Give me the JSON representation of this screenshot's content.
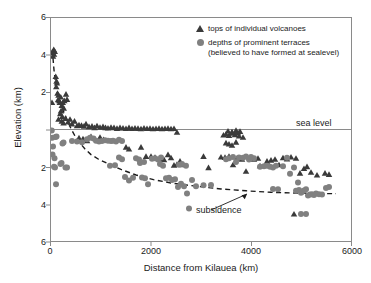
{
  "chart_data": {
    "type": "scatter",
    "title": "",
    "xlabel": "Distance from Kilauea (km)",
    "ylabel": "Elevation (km)",
    "xlim": [
      0,
      6000
    ],
    "ylim": [
      -6,
      6
    ],
    "xticks": [
      0,
      2000,
      4000,
      6000
    ],
    "xticklabels": [
      "0",
      "2000",
      "4000",
      "6000"
    ],
    "yticks": [
      6,
      4,
      2,
      0,
      -2,
      -4,
      -6
    ],
    "yticklabels": [
      "6",
      "4",
      "2",
      "",
      "2",
      "4",
      "6"
    ],
    "grid": false,
    "legend_position": "top-right",
    "annotations": [
      {
        "name": "sea-level-line",
        "text": "sea level",
        "y": 0,
        "type": "hline"
      },
      {
        "name": "subsidence-curve",
        "text": "subsidence",
        "type": "arrow-label",
        "points_to": [
          4450,
          -3.25
        ]
      }
    ],
    "series": [
      {
        "name": "tops of individual volcanoes",
        "marker": "triangle",
        "color": "#3a3a3a",
        "points": [
          [
            30,
            4.15
          ],
          [
            55,
            4.3
          ],
          [
            75,
            4.2
          ],
          [
            60,
            4.05
          ],
          [
            40,
            3.95
          ],
          [
            20,
            1.45
          ],
          [
            95,
            2.85
          ],
          [
            110,
            2.6
          ],
          [
            120,
            2.5
          ],
          [
            105,
            2.3
          ],
          [
            130,
            1.95
          ],
          [
            150,
            1.85
          ],
          [
            140,
            1.6
          ],
          [
            165,
            1.55
          ],
          [
            175,
            1.45
          ],
          [
            195,
            1.75
          ],
          [
            215,
            1.3
          ],
          [
            235,
            1.45
          ],
          [
            255,
            1.15
          ],
          [
            200,
            1.0
          ],
          [
            185,
            0.85
          ],
          [
            225,
            0.7
          ],
          [
            265,
            1.55
          ],
          [
            300,
            1.9
          ],
          [
            320,
            1.62
          ],
          [
            150,
            0.55
          ],
          [
            215,
            0.45
          ],
          [
            250,
            0.35
          ],
          [
            290,
            0.6
          ],
          [
            340,
            0.4
          ],
          [
            380,
            0.55
          ],
          [
            420,
            0.3
          ],
          [
            470,
            0.45
          ],
          [
            520,
            0.2
          ],
          [
            560,
            0.25
          ],
          [
            610,
            0.22
          ],
          [
            660,
            0.18
          ],
          [
            700,
            0.3
          ],
          [
            760,
            0.15
          ],
          [
            820,
            0.18
          ],
          [
            870,
            0.1
          ],
          [
            920,
            0.2
          ],
          [
            980,
            0.12
          ],
          [
            1040,
            0.15
          ],
          [
            1090,
            0.1
          ],
          [
            1140,
            0.08
          ],
          [
            1200,
            0.12
          ],
          [
            1260,
            0.1
          ],
          [
            1320,
            0.06
          ],
          [
            1380,
            0.1
          ],
          [
            1440,
            0.08
          ],
          [
            1500,
            0.05
          ],
          [
            1560,
            0.1
          ],
          [
            1620,
            0.05
          ],
          [
            1680,
            0.08
          ],
          [
            1740,
            0.06
          ],
          [
            1800,
            0.04
          ],
          [
            1860,
            0.08
          ],
          [
            1920,
            0.05
          ],
          [
            1980,
            0.06
          ],
          [
            2040,
            0.04
          ],
          [
            2100,
            0.05
          ],
          [
            2160,
            0.06
          ],
          [
            2220,
            0.04
          ],
          [
            2280,
            0.05
          ],
          [
            2340,
            0.06
          ],
          [
            2400,
            0.04
          ],
          [
            2460,
            0.05
          ],
          [
            2520,
            -0.15
          ],
          [
            560,
            -0.45
          ],
          [
            640,
            -0.5
          ],
          [
            720,
            -0.6
          ],
          [
            800,
            -0.38
          ],
          [
            980,
            -0.42
          ],
          [
            1050,
            -0.55
          ],
          [
            1500,
            -0.95
          ],
          [
            1560,
            -1.05
          ],
          [
            1800,
            -0.95
          ],
          [
            1900,
            -1.45
          ],
          [
            2000,
            -1.45
          ],
          [
            2080,
            -1.5
          ],
          [
            2200,
            -1.6
          ],
          [
            2260,
            -1.62
          ],
          [
            2340,
            -1.35
          ],
          [
            2400,
            -1.52
          ],
          [
            2460,
            -1.92
          ],
          [
            2520,
            -1.88
          ],
          [
            2580,
            -1.7
          ],
          [
            2640,
            -1.9
          ],
          [
            3050,
            -1.45
          ],
          [
            3150,
            -2.05
          ],
          [
            3450,
            -0.3
          ],
          [
            3500,
            -0.25
          ],
          [
            3560,
            -0.32
          ],
          [
            3620,
            -0.2
          ],
          [
            3680,
            -0.28
          ],
          [
            3740,
            -0.18
          ],
          [
            3500,
            -0.72
          ],
          [
            3560,
            -0.78
          ],
          [
            3620,
            -0.85
          ],
          [
            3700,
            -0.68
          ],
          [
            3400,
            -1.48
          ],
          [
            3480,
            -1.5
          ],
          [
            3560,
            -1.45
          ],
          [
            3640,
            -1.9
          ],
          [
            3720,
            -1.55
          ],
          [
            3820,
            -1.6
          ],
          [
            3900,
            -2.25
          ],
          [
            4180,
            -1.95
          ],
          [
            4320,
            -1.7
          ],
          [
            4400,
            -1.65
          ],
          [
            4480,
            -1.6
          ],
          [
            4560,
            -1.9
          ],
          [
            4640,
            -1.52
          ],
          [
            4720,
            -1.58
          ],
          [
            4800,
            -1.48
          ],
          [
            4900,
            -1.55
          ],
          [
            4980,
            -2.35
          ],
          [
            5060,
            -2.1
          ],
          [
            5120,
            -2.0
          ],
          [
            5200,
            -2.3
          ],
          [
            5320,
            -2.45
          ],
          [
            5480,
            -2.35
          ],
          [
            5560,
            -2.42
          ],
          [
            4860,
            -4.55
          ],
          [
            3540,
            -0.08
          ],
          [
            3620,
            -0.12
          ],
          [
            3700,
            -0.05
          ],
          [
            3780,
            -0.1
          ],
          [
            3760,
            -0.35
          ],
          [
            3840,
            -0.42
          ],
          [
            4060,
            -1.6
          ],
          [
            4140,
            -1.55
          ]
        ]
      },
      {
        "name": "depths of prominent terraces",
        "marker": "circle",
        "color": "#808080",
        "points": [
          [
            15,
            -0.05
          ],
          [
            25,
            -0.45
          ],
          [
            40,
            -0.92
          ],
          [
            30,
            -1.35
          ],
          [
            90,
            -0.4
          ],
          [
            110,
            -0.38
          ],
          [
            60,
            -2.0
          ],
          [
            80,
            -2.05
          ],
          [
            70,
            -1.55
          ],
          [
            100,
            -2.95
          ],
          [
            190,
            -1.85
          ],
          [
            210,
            -1.8
          ],
          [
            230,
            -0.75
          ],
          [
            250,
            -0.7
          ],
          [
            290,
            -2.05
          ],
          [
            320,
            -2.05
          ],
          [
            420,
            -0.62
          ],
          [
            520,
            -0.65
          ],
          [
            620,
            -0.68
          ],
          [
            720,
            -0.52
          ],
          [
            780,
            -0.45
          ],
          [
            850,
            -0.48
          ],
          [
            900,
            -0.6
          ],
          [
            960,
            -0.65
          ],
          [
            1020,
            -0.62
          ],
          [
            1080,
            -0.58
          ],
          [
            1140,
            -0.6
          ],
          [
            1200,
            -0.62
          ],
          [
            1240,
            -0.6
          ],
          [
            1300,
            -0.65
          ],
          [
            1360,
            -0.55
          ],
          [
            1420,
            -0.62
          ],
          [
            1180,
            -1.95
          ],
          [
            1280,
            -1.92
          ],
          [
            1360,
            -1.5
          ],
          [
            1420,
            -1.6
          ],
          [
            1480,
            -2.55
          ],
          [
            1560,
            -2.75
          ],
          [
            1640,
            -2.6
          ],
          [
            1700,
            -1.55
          ],
          [
            1760,
            -1.62
          ],
          [
            1820,
            -2.58
          ],
          [
            1880,
            -2.62
          ],
          [
            1940,
            -2.95
          ],
          [
            1780,
            -1.8
          ],
          [
            1860,
            -1.75
          ],
          [
            2020,
            -1.58
          ],
          [
            2080,
            -1.55
          ],
          [
            2140,
            -1.62
          ],
          [
            2200,
            -1.5
          ],
          [
            2180,
            -1.85
          ],
          [
            2240,
            -1.95
          ],
          [
            2300,
            -2.62
          ],
          [
            2360,
            -2.6
          ],
          [
            2420,
            -2.72
          ],
          [
            2480,
            -2.68
          ],
          [
            2540,
            -3.1
          ],
          [
            2600,
            -2.92
          ],
          [
            2660,
            -3.05
          ],
          [
            2720,
            -3.45
          ],
          [
            2760,
            -4.25
          ],
          [
            2820,
            -2.72
          ],
          [
            2560,
            -1.9
          ],
          [
            2620,
            -1.85
          ],
          [
            2700,
            -1.95
          ],
          [
            3050,
            -3.0
          ],
          [
            3500,
            -1.6
          ],
          [
            3560,
            -1.55
          ],
          [
            3640,
            -1.48
          ],
          [
            3760,
            -1.5
          ],
          [
            3700,
            -1.75
          ],
          [
            3840,
            -1.52
          ],
          [
            3900,
            -1.45
          ],
          [
            3960,
            -1.62
          ],
          [
            4000,
            -1.48
          ],
          [
            4060,
            -1.55
          ],
          [
            4180,
            -2.0
          ],
          [
            4260,
            -1.98
          ],
          [
            4320,
            -1.95
          ],
          [
            4380,
            -2.0
          ],
          [
            4440,
            -2.05
          ],
          [
            4500,
            -1.95
          ],
          [
            4640,
            -1.98
          ],
          [
            4720,
            -1.52
          ],
          [
            4780,
            -2.38
          ],
          [
            4860,
            -2.05
          ],
          [
            4940,
            -2.85
          ],
          [
            5000,
            -3.4
          ],
          [
            5060,
            -3.28
          ],
          [
            5100,
            -3.22
          ],
          [
            5140,
            -3.55
          ],
          [
            5180,
            -3.5
          ],
          [
            5220,
            -3.48
          ],
          [
            5260,
            -3.52
          ],
          [
            5300,
            -3.45
          ],
          [
            5360,
            -3.48
          ],
          [
            5420,
            -3.5
          ],
          [
            5500,
            -3.15
          ],
          [
            5560,
            -3.1
          ],
          [
            5000,
            -4.55
          ],
          [
            5100,
            -4.55
          ],
          [
            4440,
            -3.2
          ],
          [
            4540,
            -3.22
          ],
          [
            4900,
            -3.3
          ],
          [
            4960,
            -3.25
          ],
          [
            5020,
            -3.35
          ],
          [
            2900,
            -3.05
          ],
          [
            3200,
            -2.98
          ]
        ]
      }
    ],
    "curves": [
      {
        "name": "subsidence-curve",
        "style": "dashed",
        "color": "#1a1a1a",
        "points": [
          [
            25,
            4.3
          ],
          [
            60,
            3.2
          ],
          [
            95,
            2.45
          ],
          [
            130,
            1.95
          ],
          [
            170,
            1.55
          ],
          [
            215,
            1.2
          ],
          [
            270,
            0.85
          ],
          [
            330,
            0.45
          ],
          [
            400,
            0.05
          ],
          [
            480,
            -0.35
          ],
          [
            570,
            -0.7
          ],
          [
            680,
            -1.05
          ],
          [
            800,
            -1.35
          ],
          [
            950,
            -1.6
          ],
          [
            1150,
            -1.85
          ],
          [
            1400,
            -2.15
          ],
          [
            1700,
            -2.45
          ],
          [
            2050,
            -2.7
          ],
          [
            2450,
            -2.9
          ],
          [
            2900,
            -3.05
          ],
          [
            3400,
            -3.2
          ],
          [
            3900,
            -3.3
          ],
          [
            4400,
            -3.38
          ],
          [
            4900,
            -3.42
          ],
          [
            5400,
            -3.45
          ],
          [
            5700,
            -3.45
          ]
        ]
      }
    ]
  },
  "legend": {
    "items": [
      {
        "marker": "triangle",
        "label_line1": "tops of individual volcanoes",
        "label_line2": ""
      },
      {
        "marker": "circle",
        "label_line1": "depths of prominent terraces",
        "label_line2": "(believed to have formed at sealevel)"
      }
    ]
  },
  "annotations": {
    "sea_level": "sea level",
    "subsidence": "subsidence"
  }
}
